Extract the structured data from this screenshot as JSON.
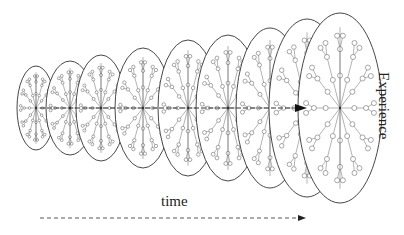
{
  "diagram": {
    "labels": {
      "time": "time",
      "experience": "Experience"
    },
    "colors": {
      "outline": "#333333",
      "edges": "#555555",
      "arrow": "#222222",
      "background": "#ffffff"
    },
    "center_y": 108,
    "ellipses": [
      {
        "cx": 36,
        "rx": 19,
        "ry": 42
      },
      {
        "cx": 70,
        "rx": 24,
        "ry": 47
      },
      {
        "cx": 101,
        "rx": 25,
        "ry": 53
      },
      {
        "cx": 143,
        "rx": 28,
        "ry": 60
      },
      {
        "cx": 188,
        "rx": 30,
        "ry": 68
      },
      {
        "cx": 228,
        "rx": 32,
        "ry": 73
      },
      {
        "cx": 270,
        "rx": 34,
        "ry": 80
      },
      {
        "cx": 307,
        "rx": 38,
        "ry": 89
      },
      {
        "cx": 340,
        "rx": 42,
        "ry": 95
      }
    ],
    "center_arrow": {
      "x1": 40,
      "x2": 306,
      "y": 108
    },
    "time_arrow": {
      "x1": 40,
      "x2": 305,
      "y": 218,
      "dashed": true
    }
  }
}
